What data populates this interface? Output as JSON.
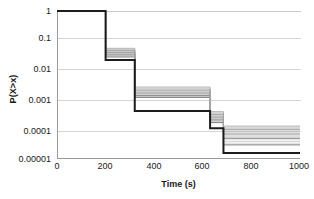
{
  "chart_data": {
    "type": "line",
    "subtype": "step-survival-curves",
    "title": "",
    "xlabel": "Time (s)",
    "ylabel": "P(X>x)",
    "xlim": [
      0,
      1000
    ],
    "ylim": [
      1e-05,
      1
    ],
    "yscale": "log",
    "xscale": "linear",
    "grid": true,
    "legend": "none",
    "xticks": [
      0,
      200,
      400,
      600,
      800,
      1000
    ],
    "xtick_labels": [
      "0",
      "200",
      "400",
      "600",
      "800",
      "1000"
    ],
    "yticks": [
      1,
      0.1,
      0.01,
      0.001,
      0.0001,
      1e-05
    ],
    "ytick_labels": [
      "1",
      "0.1",
      "0.01",
      "0.001",
      "0.0001",
      "0.00001"
    ],
    "step_edges": [
      0,
      200,
      320,
      630,
      685,
      1000
    ],
    "band_description": "Dense bundle of many overlapping gray step curves plus one heavier dark curve forming the lower envelope",
    "series": [
      {
        "name": "band-upper-envelope",
        "color": "#b4b4b4",
        "values": [
          1.0,
          0.055,
          0.0027,
          0.0004,
          0.00013
        ]
      },
      {
        "name": "band-mid-upper",
        "color": "#9e9e9e",
        "values": [
          1.0,
          0.046,
          0.0021,
          0.00032,
          0.0001
        ]
      },
      {
        "name": "band-mid",
        "color": "#8a8a8a",
        "values": [
          1.0,
          0.039,
          0.0017,
          0.00026,
          7e-05
        ]
      },
      {
        "name": "band-mid-lower",
        "color": "#777777",
        "values": [
          1.0,
          0.033,
          0.0014,
          0.00021,
          5e-05
        ]
      },
      {
        "name": "band-lower-envelope",
        "color": "#6a6a6a",
        "values": [
          1.0,
          0.028,
          0.0012,
          0.00017,
          3e-05
        ]
      },
      {
        "name": "dark-reference-curve",
        "color": "#1c1c1c",
        "values": [
          1.0,
          0.022,
          0.00042,
          0.00011,
          1.6e-05
        ]
      }
    ]
  },
  "axes": {
    "y_title": "P(X>x)",
    "x_title": "Time (s)"
  }
}
